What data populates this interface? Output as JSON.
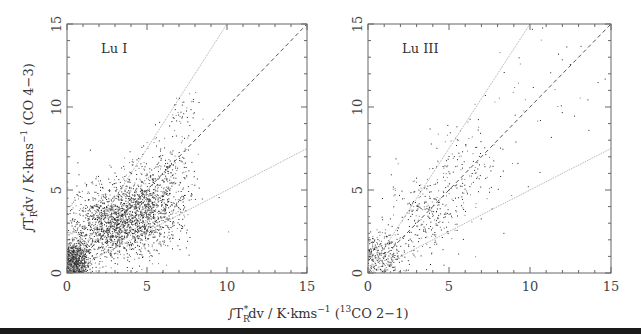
{
  "chart_data": [
    {
      "type": "scatter",
      "panel_label": "Lu I",
      "xlabel": "∫T_R*dv / K·kms^-1 (13CO 2-1)",
      "ylabel": "∫T_R*dv / K·kms^-1 (CO 4-3)",
      "xlim": [
        0,
        15
      ],
      "ylim": [
        0,
        15
      ],
      "xticks": [
        0,
        5,
        10,
        15
      ],
      "yticks": [
        0,
        5,
        10,
        15
      ],
      "grid": false,
      "reference_lines": [
        {
          "slope": 1.5,
          "style": "dotted",
          "label": "y = 1.5x"
        },
        {
          "slope": 1.0,
          "style": "dashed",
          "label": "y = x"
        },
        {
          "slope": 0.5,
          "style": "dotted",
          "label": "y = 0.5x"
        }
      ],
      "point_clusters": [
        {
          "cx": 0.5,
          "cy": 0.8,
          "sx": 0.45,
          "sy": 0.6,
          "n": 700
        },
        {
          "cx": 2.5,
          "cy": 2.8,
          "sx": 1.2,
          "sy": 1.1,
          "n": 900
        },
        {
          "cx": 4.5,
          "cy": 3.6,
          "sx": 1.3,
          "sy": 1.2,
          "n": 1100
        },
        {
          "cx": 6.0,
          "cy": 5.5,
          "sx": 1.0,
          "sy": 1.4,
          "n": 300
        },
        {
          "cx": 7.3,
          "cy": 9.8,
          "sx": 0.4,
          "sy": 0.6,
          "n": 40
        }
      ],
      "approx_point_count": 3040
    },
    {
      "type": "scatter",
      "panel_label": "Lu III",
      "xlabel": "∫T_R*dv / K·kms^-1 (13CO 2-1)",
      "ylabel": "",
      "xlim": [
        0,
        15
      ],
      "ylim": [
        0,
        15
      ],
      "xticks": [
        0,
        5,
        10,
        15
      ],
      "yticks": [
        0,
        5,
        10,
        15
      ],
      "grid": false,
      "reference_lines": [
        {
          "slope": 1.5,
          "style": "dotted",
          "label": "y = 1.5x"
        },
        {
          "slope": 1.0,
          "style": "dashed",
          "label": "y = x"
        },
        {
          "slope": 0.5,
          "style": "dotted",
          "label": "y = 0.5x"
        }
      ],
      "point_clusters": [
        {
          "cx": 0.8,
          "cy": 1.0,
          "sx": 0.7,
          "sy": 0.8,
          "n": 260
        },
        {
          "cx": 3.5,
          "cy": 3.6,
          "sx": 1.1,
          "sy": 1.2,
          "n": 260
        },
        {
          "cx": 6.0,
          "cy": 6.3,
          "sx": 1.3,
          "sy": 1.6,
          "n": 160
        },
        {
          "cx": 10.5,
          "cy": 11.0,
          "sx": 2.0,
          "sy": 2.0,
          "n": 40
        }
      ],
      "approx_point_count": 720
    }
  ],
  "figure": {
    "panels": [
      "Lu I",
      "Lu III"
    ],
    "shared_xlabel": {
      "prefix": "∫T",
      "sub": "R",
      "sup": "*",
      "mid": "dv / K·kms",
      "exp": "−1",
      "paren_open": " (",
      "iso": "13",
      "tail": "CO 2−1)"
    },
    "ylabel": {
      "prefix": "∫T",
      "sub": "R",
      "sup": "*",
      "mid": "dv / K·kms",
      "exp": "−1",
      "tail": " (CO 4−3)"
    },
    "tick_labels": [
      "0",
      "5",
      "10",
      "15"
    ]
  }
}
